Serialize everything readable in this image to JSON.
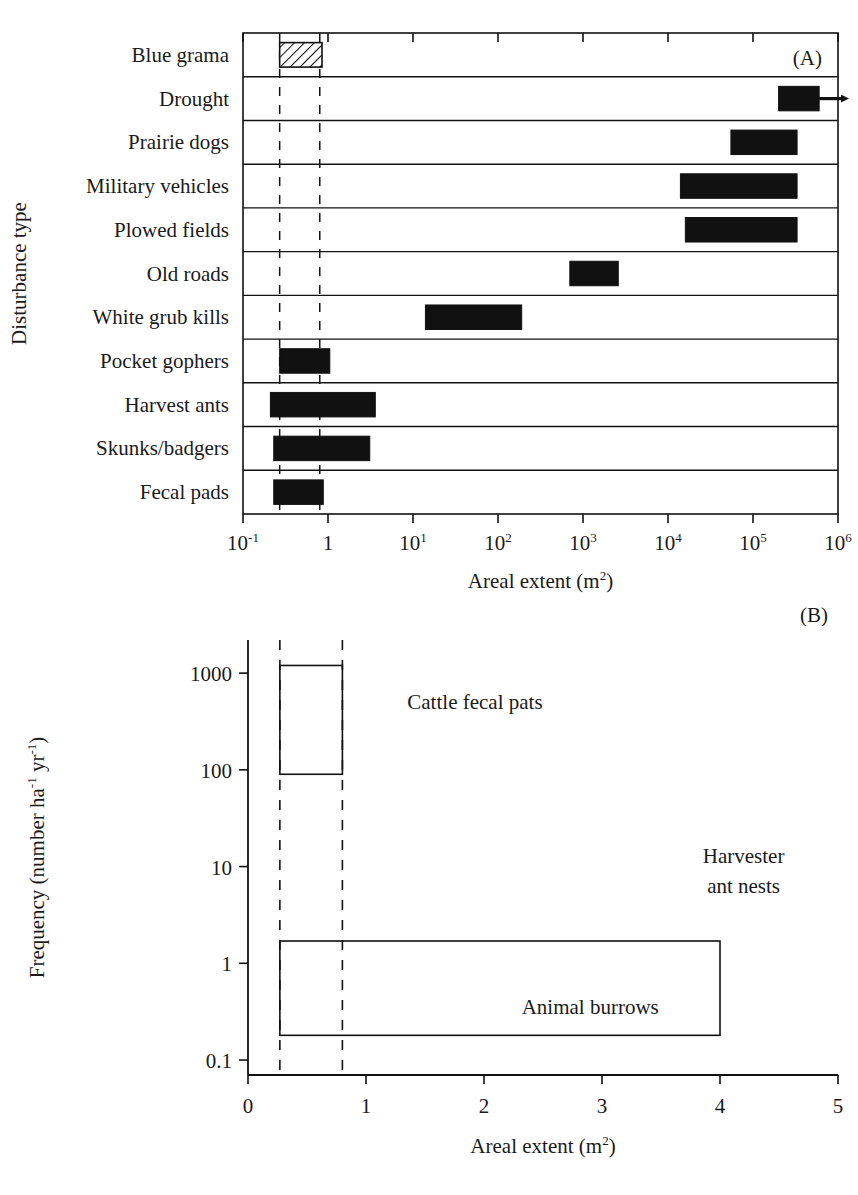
{
  "figure": {
    "panels": [
      "A",
      "B"
    ]
  },
  "chart_data": [
    {
      "type": "bar",
      "panel_label": "(A)",
      "title": "",
      "xlabel": "Areal extent (m2)",
      "xlabel_base": "Areal extent (m",
      "xlabel_sup": "2",
      "xlabel_tail": ")",
      "ylabel": "Disturbance type",
      "xscale": "log",
      "xlim": [
        0.1,
        1000000
      ],
      "xticks": [
        0.1,
        1,
        10,
        100,
        1000,
        10000,
        100000,
        1000000
      ],
      "xticklabels": [
        "10-1",
        "1",
        "101",
        "102",
        "103",
        "104",
        "105",
        "106"
      ],
      "xtick_mantissa": [
        "10",
        "1",
        "10",
        "10",
        "10",
        "10",
        "10",
        "10"
      ],
      "xtick_exponent": [
        "-1",
        "",
        "1",
        "2",
        "3",
        "4",
        "5",
        "6"
      ],
      "reference_lines": [
        0.27,
        0.8
      ],
      "reference_line_style": "dashed",
      "grid": false,
      "categories": [
        "Blue grama",
        "Drought",
        "Prairie dogs",
        "Military vehicles",
        "Plowed fields",
        "Old roads",
        "White grub kills",
        "Pocket gophers",
        "Harvest ants",
        "Skunks/badgers",
        "Fecal pads"
      ],
      "bars": [
        {
          "category": "Blue grama",
          "xmin": 0.27,
          "xmax": 0.85,
          "fill": "hatched",
          "arrow": false
        },
        {
          "category": "Drought",
          "xmin": 200000,
          "xmax": 600000,
          "fill": "solid",
          "arrow": true
        },
        {
          "category": "Prairie dogs",
          "xmin": 55000,
          "xmax": 330000,
          "fill": "solid",
          "arrow": false
        },
        {
          "category": "Military vehicles",
          "xmin": 14000,
          "xmax": 330000,
          "fill": "solid",
          "arrow": false
        },
        {
          "category": "Plowed fields",
          "xmin": 16000,
          "xmax": 330000,
          "fill": "solid",
          "arrow": false
        },
        {
          "category": "Old roads",
          "xmin": 700,
          "xmax": 2600,
          "fill": "solid",
          "arrow": false
        },
        {
          "category": "White grub kills",
          "xmin": 14,
          "xmax": 190,
          "fill": "solid",
          "arrow": false
        },
        {
          "category": "Pocket gophers",
          "xmin": 0.27,
          "xmax": 1.05,
          "fill": "solid",
          "arrow": false
        },
        {
          "category": "Harvest ants",
          "xmin": 0.21,
          "xmax": 3.6,
          "fill": "solid",
          "arrow": false
        },
        {
          "category": "Skunks/badgers",
          "xmin": 0.23,
          "xmax": 3.1,
          "fill": "solid",
          "arrow": false
        },
        {
          "category": "Fecal pads",
          "xmin": 0.23,
          "xmax": 0.88,
          "fill": "solid",
          "arrow": false
        }
      ]
    },
    {
      "type": "bar",
      "panel_label": "(B)",
      "title": "",
      "xlabel": "Areal extent (m2)",
      "xlabel_base": "Areal extent (m",
      "xlabel_sup": "2",
      "xlabel_tail": ")",
      "ylabel": "Frequency (number ha-1 yr-1)",
      "ylabel_part1": "Frequency (number ha",
      "ylabel_sup1": "-1",
      "ylabel_part2": " yr",
      "ylabel_sup2": "-1",
      "ylabel_part3": ")",
      "xscale": "linear",
      "yscale": "log",
      "xlim": [
        0,
        5
      ],
      "ylim": [
        0.07,
        2200
      ],
      "xticks": [
        0,
        1,
        2,
        3,
        4,
        5
      ],
      "xticklabels": [
        "0",
        "1",
        "2",
        "3",
        "4",
        "5"
      ],
      "yticks": [
        0.1,
        1,
        10,
        100,
        1000
      ],
      "yticklabels": [
        "0.1",
        "1",
        "10",
        "100",
        "1000"
      ],
      "reference_lines": [
        0.27,
        0.8
      ],
      "reference_line_style": "dashed",
      "grid": false,
      "boxes": [
        {
          "label": "Cattle fecal pats",
          "xmin": 0.27,
          "xmax": 0.8,
          "ymin": 90,
          "ymax": 1200,
          "label_x": 1.35,
          "label_y": 430,
          "label_anchor": "start",
          "label_lines": [
            "Cattle fecal pats"
          ]
        },
        {
          "label": "Animal burrows",
          "xmin": 0.27,
          "xmax": 4.0,
          "ymin": 0.18,
          "ymax": 1.7,
          "label_x": 2.9,
          "label_y": 0.3,
          "label_anchor": "middle",
          "label_lines": [
            "Animal burrows"
          ]
        }
      ],
      "annotations": [
        {
          "label": "Harvester ant nests",
          "x": 4.2,
          "y": 11,
          "lines": [
            "Harvester",
            "ant nests"
          ]
        }
      ]
    }
  ]
}
